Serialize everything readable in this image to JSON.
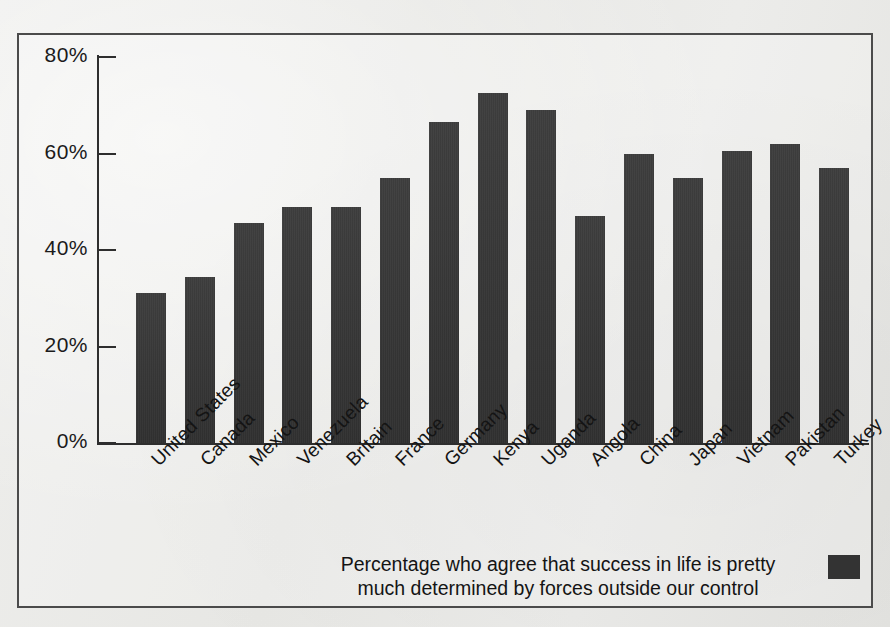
{
  "chart_data": {
    "type": "bar",
    "title": "",
    "subtitle": "",
    "xlabel": "",
    "ylabel": "",
    "ylim": [
      0,
      80
    ],
    "yticks": [
      "0%",
      "20%",
      "40%",
      "60%",
      "80%"
    ],
    "ytick_values": [
      0,
      20,
      40,
      60,
      80
    ],
    "grid": false,
    "legend_position": "bottom-center",
    "legend": [
      {
        "label": "Percentage who agree that success in life is pretty much determined by forces outside our control",
        "color": "#333333"
      }
    ],
    "bar_color": "#333333",
    "categories": [
      "United States",
      "Canada",
      "Mexico",
      "Venezuela",
      "Britain",
      "France",
      "Germany",
      "Kenya",
      "Uganda",
      "Angola",
      "China",
      "Japan",
      "Vietnam",
      "Pakistan",
      "Turkey"
    ],
    "values": [
      31,
      34.5,
      45.5,
      49,
      49,
      55,
      66.5,
      72.5,
      69,
      47,
      60,
      55,
      60.5,
      62,
      57
    ],
    "annotations": []
  },
  "legend": {
    "line1": "Percentage who agree that success in life is pretty",
    "line2": "much determined by forces outside our control"
  }
}
